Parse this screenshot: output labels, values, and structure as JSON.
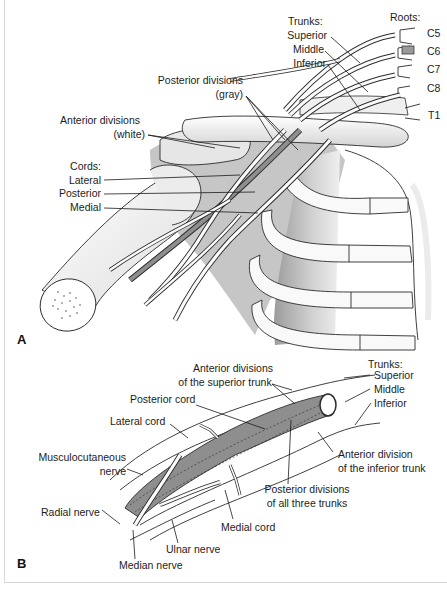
{
  "figure": {
    "colors": {
      "outline": "#2a2a2a",
      "nerve_white": "#fbfbfb",
      "posterior_gray": "#8e8e8e",
      "bone_shade": "#d9d9d9",
      "chest_shade": "#bdbdbd",
      "background": "#ffffff"
    }
  },
  "panel_a": {
    "letter": "A",
    "roots": {
      "heading": "Roots:",
      "items": [
        "C5",
        "C6",
        "C7",
        "C8",
        "T1"
      ]
    },
    "trunks": {
      "heading": "Trunks:",
      "items": [
        "Superior",
        "Middle",
        "Inferior"
      ]
    },
    "posterior_divisions": {
      "line1": "Posterior divisions",
      "line2": "(gray)"
    },
    "anterior_divisions": {
      "line1": "Anterior divisions",
      "line2": "(white)"
    },
    "cords": {
      "heading": "Cords:",
      "items": [
        "Lateral",
        "Posterior",
        "Medial"
      ]
    }
  },
  "panel_b": {
    "letter": "B",
    "trunks": {
      "heading": "Trunks:",
      "items": [
        "Superior",
        "Middle",
        "Inferior"
      ]
    },
    "anterior_divisions_superior": {
      "line1": "Anterior divisions",
      "line2": "of the superior trunk"
    },
    "posterior_cord": "Posterior cord",
    "lateral_cord": "Lateral cord",
    "musculocutaneous": {
      "line1": "Musculocutaneous",
      "line2": "nerve"
    },
    "anterior_division_inferior": {
      "line1": "Anterior division",
      "line2": "of the inferior trunk"
    },
    "posterior_divisions_all": {
      "line1": "Posterior divisions",
      "line2": "of all three trunks"
    },
    "radial_nerve": "Radial nerve",
    "medial_cord": "Medial cord",
    "ulnar_nerve": "Ulnar nerve",
    "median_nerve": "Median nerve"
  }
}
